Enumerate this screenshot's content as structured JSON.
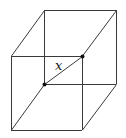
{
  "figure": {
    "type": "cube-diagram",
    "diagonal_label": "x",
    "marked_vertices": [
      "back-bottom-left",
      "front-top-right"
    ],
    "colors": {
      "edge": "#3a3a3a",
      "dot": "#111111",
      "label": "#222222",
      "background": "#ffffff"
    }
  }
}
